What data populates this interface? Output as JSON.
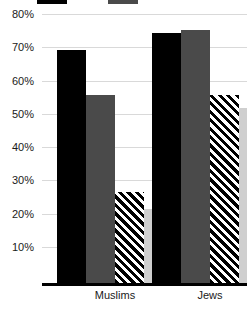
{
  "chart_data": {
    "type": "bar",
    "title": "",
    "subtitle": "",
    "xlabel": "",
    "ylabel": "",
    "categories": [
      "Muslims",
      "Jews"
    ],
    "series": [
      {
        "name": "series-1",
        "fill": "black",
        "color": "#000000",
        "values": [
          72,
          77
        ]
      },
      {
        "name": "series-2",
        "fill": "dark-gray",
        "color": "#4a4a4a",
        "values": [
          58,
          78
        ]
      },
      {
        "name": "series-3",
        "fill": "hatched",
        "color": "#000000",
        "values": [
          28,
          58
        ]
      },
      {
        "name": "series-4",
        "fill": "light-gray",
        "color": "#cfcfcf",
        "values": [
          23,
          54
        ]
      }
    ],
    "ylim": [
      0,
      83
    ],
    "yticks": [
      10,
      20,
      30,
      40,
      50,
      60,
      70,
      80
    ],
    "ytick_labels": [
      "10%",
      "20%",
      "30%",
      "40%",
      "50%",
      "60%",
      "70%",
      "80%"
    ],
    "grid": true,
    "legend_position": "top",
    "legend_cropped": true
  },
  "yaxis": {
    "ticks": [
      {
        "value": 80,
        "label": "80%"
      },
      {
        "value": 70,
        "label": "70%"
      },
      {
        "value": 60,
        "label": "60%"
      },
      {
        "value": 50,
        "label": "50%"
      },
      {
        "value": 40,
        "label": "40%"
      },
      {
        "value": 30,
        "label": "30%"
      },
      {
        "value": 20,
        "label": "20%"
      },
      {
        "value": 10,
        "label": "10%"
      }
    ]
  },
  "xaxis": {
    "categories": [
      {
        "label": "Muslims"
      },
      {
        "label": "Jews"
      }
    ]
  },
  "legend": {
    "cropped_note": "",
    "entries": [
      {
        "label": "",
        "swatch": "black"
      },
      {
        "label": "",
        "swatch": "dark-gray"
      }
    ]
  }
}
